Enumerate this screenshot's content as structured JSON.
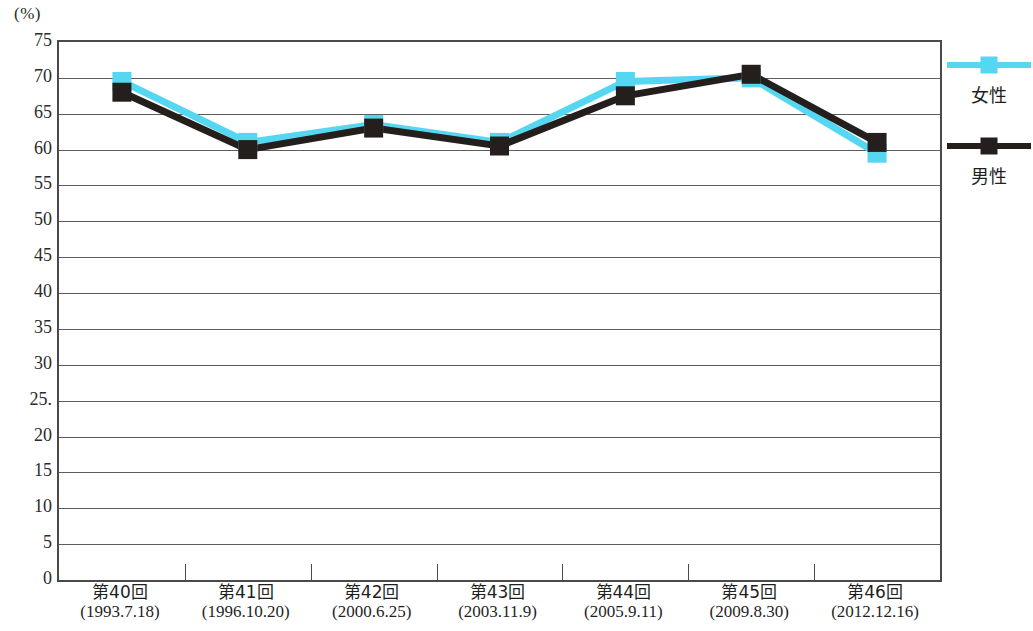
{
  "chart_data": {
    "type": "line",
    "title": "",
    "subtitle": "",
    "xlabel": "",
    "ylabel": "",
    "y_unit_label": "(%)",
    "ylim": [
      0,
      75
    ],
    "y_ticks": [
      "0",
      "5",
      "10",
      "15",
      "20",
      "25.",
      "30",
      "35",
      "40",
      "45",
      "50",
      "55",
      "60",
      "65",
      "70",
      "75"
    ],
    "y_tick_values": [
      0,
      5,
      10,
      15,
      20,
      25,
      30,
      35,
      40,
      45,
      50,
      55,
      60,
      65,
      70,
      75
    ],
    "grid": true,
    "grid_orientation": "horizontal",
    "legend_position": "right",
    "categories": [
      "第40回",
      "第41回",
      "第42回",
      "第43回",
      "第44回",
      "第45回",
      "第46回"
    ],
    "category_sublabels": [
      "(1993.7.18)",
      "(1996.10.20)",
      "(2000.6.25)",
      "(2003.11.9)",
      "(2005.9.11)",
      "(2009.8.30)",
      "(2012.12.16)"
    ],
    "series": [
      {
        "name": "女性",
        "color": "#55D7F2",
        "marker": "square",
        "values": [
          69.5,
          61.0,
          63.5,
          61.0,
          69.5,
          70.0,
          59.5
        ]
      },
      {
        "name": "男性",
        "color": "#241F1C",
        "marker": "square",
        "values": [
          68.0,
          60.0,
          63.0,
          60.5,
          67.5,
          70.5,
          61.0
        ]
      }
    ]
  },
  "legend": {
    "entries": [
      {
        "label": "女性",
        "color": "#55D7F2"
      },
      {
        "label": "男性",
        "color": "#241F1C"
      }
    ]
  },
  "axes": {
    "frame_color": "#4a4a4a",
    "grid_color": "#5c5c5c"
  }
}
